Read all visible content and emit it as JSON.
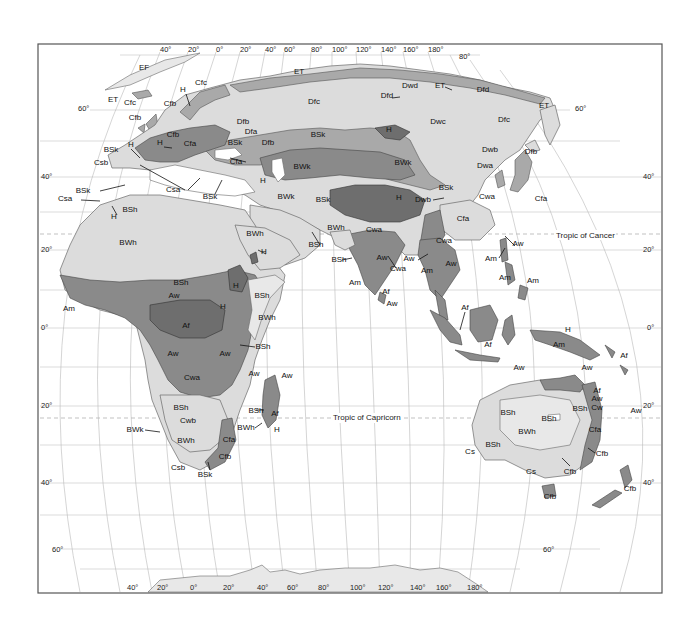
{
  "map": {
    "title": "Köppen climate classification — Eastern Hemisphere",
    "colors": {
      "background": "#ffffff",
      "frame": "#555555",
      "grid": "#b8b8b8",
      "pale": "#e8e8e8",
      "light": "#dcdcdc",
      "mid": "#a9a9a9",
      "dark": "#8a8a8a",
      "darker": "#6e6e6e"
    },
    "top_longitude_labels": [
      {
        "text": "40°",
        "x": 160,
        "y": 52
      },
      {
        "text": "20°",
        "x": 188,
        "y": 52
      },
      {
        "text": "0°",
        "x": 216,
        "y": 52
      },
      {
        "text": "20°",
        "x": 240,
        "y": 52
      },
      {
        "text": "40°",
        "x": 265,
        "y": 52
      },
      {
        "text": "60°",
        "x": 284,
        "y": 52
      },
      {
        "text": "80°",
        "x": 311,
        "y": 52
      },
      {
        "text": "100°",
        "x": 332,
        "y": 52
      },
      {
        "text": "120°",
        "x": 356,
        "y": 52
      },
      {
        "text": "140°",
        "x": 381,
        "y": 52
      },
      {
        "text": "160°",
        "x": 403,
        "y": 52
      },
      {
        "text": "180°",
        "x": 428,
        "y": 52
      },
      {
        "text": "80°",
        "x": 459,
        "y": 59
      }
    ],
    "bottom_longitude_labels": [
      {
        "text": "40°",
        "x": 127,
        "y": 590
      },
      {
        "text": "20°",
        "x": 157,
        "y": 590
      },
      {
        "text": "0°",
        "x": 190,
        "y": 590
      },
      {
        "text": "20°",
        "x": 223,
        "y": 590
      },
      {
        "text": "40°",
        "x": 257,
        "y": 590
      },
      {
        "text": "60°",
        "x": 287,
        "y": 590
      },
      {
        "text": "80°",
        "x": 318,
        "y": 590
      },
      {
        "text": "100°",
        "x": 350,
        "y": 590
      },
      {
        "text": "120°",
        "x": 378,
        "y": 590
      },
      {
        "text": "140°",
        "x": 410,
        "y": 590
      },
      {
        "text": "160°",
        "x": 436,
        "y": 590
      },
      {
        "text": "180°",
        "x": 467,
        "y": 590
      }
    ],
    "left_latitude_labels": [
      {
        "text": "60°",
        "x": 78,
        "y": 111
      },
      {
        "text": "40°",
        "x": 41,
        "y": 179
      },
      {
        "text": "20°",
        "x": 41,
        "y": 252
      },
      {
        "text": "0°",
        "x": 41,
        "y": 330
      },
      {
        "text": "20°",
        "x": 41,
        "y": 408
      },
      {
        "text": "40°",
        "x": 41,
        "y": 485
      },
      {
        "text": "60°",
        "x": 52,
        "y": 552
      }
    ],
    "right_latitude_labels": [
      {
        "text": "60°",
        "x": 575,
        "y": 111
      },
      {
        "text": "40°",
        "x": 643,
        "y": 179
      },
      {
        "text": "20°",
        "x": 643,
        "y": 252
      },
      {
        "text": "0°",
        "x": 647,
        "y": 330
      },
      {
        "text": "20°",
        "x": 643,
        "y": 408
      },
      {
        "text": "40°",
        "x": 643,
        "y": 485
      },
      {
        "text": "60°",
        "x": 543,
        "y": 552
      }
    ],
    "tropics": {
      "cancer": {
        "text": "Tropic of Cancer",
        "x": 556,
        "y": 238
      },
      "capricorn": {
        "text": "Tropic of Capricorn",
        "x": 333,
        "y": 420
      }
    },
    "climate_labels": [
      {
        "text": "EF",
        "x": 144,
        "y": 70
      },
      {
        "text": "ET",
        "x": 113,
        "y": 102
      },
      {
        "text": "Cfc",
        "x": 130,
        "y": 105
      },
      {
        "text": "Cfc",
        "x": 201,
        "y": 85
      },
      {
        "text": "H",
        "x": 183,
        "y": 92
      },
      {
        "text": "Cfb",
        "x": 170,
        "y": 106
      },
      {
        "text": "Cfb",
        "x": 135,
        "y": 120
      },
      {
        "text": "ET",
        "x": 299,
        "y": 74
      },
      {
        "text": "Dfc",
        "x": 314,
        "y": 104
      },
      {
        "text": "Dwd",
        "x": 410,
        "y": 88
      },
      {
        "text": "ET",
        "x": 440,
        "y": 88
      },
      {
        "text": "Dfd",
        "x": 387,
        "y": 98
      },
      {
        "text": "Dfd",
        "x": 483,
        "y": 92
      },
      {
        "text": "ET",
        "x": 544,
        "y": 108
      },
      {
        "text": "Dfc",
        "x": 504,
        "y": 122
      },
      {
        "text": "Dwc",
        "x": 438,
        "y": 124
      },
      {
        "text": "Dfb",
        "x": 243,
        "y": 124
      },
      {
        "text": "Dfa",
        "x": 251,
        "y": 134
      },
      {
        "text": "Dfb",
        "x": 268,
        "y": 145
      },
      {
        "text": "BSk",
        "x": 318,
        "y": 137
      },
      {
        "text": "H",
        "x": 389,
        "y": 132
      },
      {
        "text": "Dwb",
        "x": 490,
        "y": 152
      },
      {
        "text": "Dfb",
        "x": 531,
        "y": 154
      },
      {
        "text": "Cfb",
        "x": 173,
        "y": 137
      },
      {
        "text": "Cfa",
        "x": 190,
        "y": 146
      },
      {
        "text": "H",
        "x": 160,
        "y": 145
      },
      {
        "text": "H",
        "x": 131,
        "y": 147
      },
      {
        "text": "BSk",
        "x": 111,
        "y": 152
      },
      {
        "text": "BSk",
        "x": 235,
        "y": 145
      },
      {
        "text": "Cfa",
        "x": 236,
        "y": 164
      },
      {
        "text": "Csb",
        "x": 101,
        "y": 165
      },
      {
        "text": "BSk",
        "x": 83,
        "y": 193
      },
      {
        "text": "Csa",
        "x": 65,
        "y": 201
      },
      {
        "text": "H",
        "x": 114,
        "y": 219
      },
      {
        "text": "BSh",
        "x": 130,
        "y": 212
      },
      {
        "text": "Csa",
        "x": 173,
        "y": 192
      },
      {
        "text": "BSk",
        "x": 210,
        "y": 199
      },
      {
        "text": "H",
        "x": 263,
        "y": 183
      },
      {
        "text": "BWk",
        "x": 302,
        "y": 169
      },
      {
        "text": "BWk",
        "x": 403,
        "y": 165
      },
      {
        "text": "Dwa",
        "x": 485,
        "y": 168
      },
      {
        "text": "BSk",
        "x": 446,
        "y": 190
      },
      {
        "text": "Dwb",
        "x": 423,
        "y": 202
      },
      {
        "text": "Cwa",
        "x": 487,
        "y": 199
      },
      {
        "text": "Cfa",
        "x": 541,
        "y": 201
      },
      {
        "text": "BWk",
        "x": 286,
        "y": 199
      },
      {
        "text": "BSk",
        "x": 323,
        "y": 202
      },
      {
        "text": "H",
        "x": 399,
        "y": 200
      },
      {
        "text": "Cfa",
        "x": 463,
        "y": 221
      },
      {
        "text": "BWh",
        "x": 128,
        "y": 245
      },
      {
        "text": "BWh",
        "x": 255,
        "y": 236
      },
      {
        "text": "H",
        "x": 264,
        "y": 254
      },
      {
        "text": "BWh",
        "x": 336,
        "y": 230
      },
      {
        "text": "BSh",
        "x": 316,
        "y": 247
      },
      {
        "text": "Cwa",
        "x": 374,
        "y": 232
      },
      {
        "text": "Cwa",
        "x": 444,
        "y": 243
      },
      {
        "text": "Aw",
        "x": 518,
        "y": 246
      },
      {
        "text": "BSh",
        "x": 339,
        "y": 262
      },
      {
        "text": "Aw",
        "x": 382,
        "y": 260
      },
      {
        "text": "Aw",
        "x": 409,
        "y": 261
      },
      {
        "text": "Cwa",
        "x": 398,
        "y": 271
      },
      {
        "text": "Am",
        "x": 427,
        "y": 273
      },
      {
        "text": "Aw",
        "x": 451,
        "y": 266
      },
      {
        "text": "Am",
        "x": 491,
        "y": 261
      },
      {
        "text": "Am",
        "x": 505,
        "y": 280
      },
      {
        "text": "Am",
        "x": 533,
        "y": 283
      },
      {
        "text": "Am",
        "x": 355,
        "y": 285
      },
      {
        "text": "Af",
        "x": 386,
        "y": 294
      },
      {
        "text": "Aw",
        "x": 392,
        "y": 306
      },
      {
        "text": "Af",
        "x": 465,
        "y": 310
      },
      {
        "text": "BSh",
        "x": 181,
        "y": 285
      },
      {
        "text": "Aw",
        "x": 174,
        "y": 298
      },
      {
        "text": "H",
        "x": 236,
        "y": 288
      },
      {
        "text": "BSh",
        "x": 262,
        "y": 298
      },
      {
        "text": "Am",
        "x": 69,
        "y": 311
      },
      {
        "text": "H",
        "x": 223,
        "y": 309
      },
      {
        "text": "BWh",
        "x": 267,
        "y": 320
      },
      {
        "text": "Af",
        "x": 186,
        "y": 328
      },
      {
        "text": "H",
        "x": 568,
        "y": 332
      },
      {
        "text": "Af",
        "x": 488,
        "y": 347
      },
      {
        "text": "Am",
        "x": 559,
        "y": 347
      },
      {
        "text": "Af",
        "x": 624,
        "y": 358
      },
      {
        "text": "BSh",
        "x": 263,
        "y": 349
      },
      {
        "text": "Aw",
        "x": 173,
        "y": 356
      },
      {
        "text": "Aw",
        "x": 225,
        "y": 356
      },
      {
        "text": "Aw",
        "x": 519,
        "y": 370
      },
      {
        "text": "Aw",
        "x": 587,
        "y": 370
      },
      {
        "text": "Cwa",
        "x": 192,
        "y": 380
      },
      {
        "text": "Aw",
        "x": 254,
        "y": 376
      },
      {
        "text": "Aw",
        "x": 287,
        "y": 378
      },
      {
        "text": "Af",
        "x": 597,
        "y": 393
      },
      {
        "text": "Aw",
        "x": 597,
        "y": 401
      },
      {
        "text": "Cw",
        "x": 597,
        "y": 410
      },
      {
        "text": "Aw",
        "x": 636,
        "y": 413
      },
      {
        "text": "BSh",
        "x": 181,
        "y": 410
      },
      {
        "text": "BSh",
        "x": 256,
        "y": 413
      },
      {
        "text": "Af",
        "x": 275,
        "y": 416
      },
      {
        "text": "BSh",
        "x": 508,
        "y": 415
      },
      {
        "text": "BSh",
        "x": 549,
        "y": 421
      },
      {
        "text": "BSh",
        "x": 580,
        "y": 411
      },
      {
        "text": "Cwb",
        "x": 188,
        "y": 423
      },
      {
        "text": "BWh",
        "x": 246,
        "y": 430
      },
      {
        "text": "H",
        "x": 277,
        "y": 432
      },
      {
        "text": "BWk",
        "x": 135,
        "y": 432
      },
      {
        "text": "BWh",
        "x": 186,
        "y": 443
      },
      {
        "text": "Cfa",
        "x": 229,
        "y": 442
      },
      {
        "text": "BWh",
        "x": 527,
        "y": 434
      },
      {
        "text": "Cfa",
        "x": 595,
        "y": 432
      },
      {
        "text": "BSh",
        "x": 493,
        "y": 447
      },
      {
        "text": "Cs",
        "x": 470,
        "y": 454
      },
      {
        "text": "Cfb",
        "x": 602,
        "y": 456
      },
      {
        "text": "Csb",
        "x": 178,
        "y": 470
      },
      {
        "text": "Cfb",
        "x": 225,
        "y": 459
      },
      {
        "text": "BSk",
        "x": 205,
        "y": 477
      },
      {
        "text": "Cs",
        "x": 531,
        "y": 474
      },
      {
        "text": "Cfb",
        "x": 570,
        "y": 474
      },
      {
        "text": "Cfb",
        "x": 550,
        "y": 499
      },
      {
        "text": "Cfb",
        "x": 630,
        "y": 491
      }
    ]
  }
}
